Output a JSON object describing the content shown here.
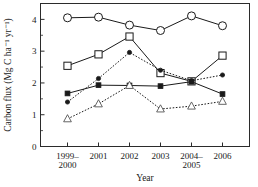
{
  "chart_data": {
    "type": "line",
    "title": "",
    "xlabel": "Year",
    "ylabel": "Carbon flux (Mg C ha⁻¹ yr⁻¹)",
    "categories": [
      "1999–2000",
      "2001",
      "2002",
      "2003",
      "2004–2005",
      "2006"
    ],
    "category_lines": [
      [
        "1999–",
        "2000"
      ],
      [
        "2001",
        ""
      ],
      [
        "2002",
        ""
      ],
      [
        "2003",
        ""
      ],
      [
        "2004–",
        "2005"
      ],
      [
        "2006",
        ""
      ]
    ],
    "ylim": [
      0,
      4.5
    ],
    "yticks": [
      0,
      1,
      2,
      3,
      4
    ],
    "ytick_labels": [
      "0",
      "1",
      "2",
      "3",
      "4"
    ],
    "y_minor_ticks": [
      0.5,
      1.5,
      2.5,
      3.5
    ],
    "grid": false,
    "legend": "none",
    "series": [
      {
        "name": "open-circle-solid",
        "marker": "circle-open",
        "line": "solid",
        "values": [
          4.05,
          4.07,
          3.82,
          3.65,
          4.11,
          3.8
        ]
      },
      {
        "name": "open-square-solid",
        "marker": "square-open",
        "line": "solid",
        "values": [
          2.54,
          2.9,
          3.46,
          2.31,
          2.05,
          2.86
        ]
      },
      {
        "name": "filled-circle-dotted",
        "marker": "circle-filled",
        "line": "dotted",
        "values": [
          1.4,
          2.14,
          2.96,
          2.4,
          2.07,
          2.25
        ]
      },
      {
        "name": "filled-square-solid",
        "marker": "square-filled",
        "line": "solid",
        "values": [
          1.67,
          1.93,
          1.92,
          1.9,
          2.04,
          1.65
        ]
      },
      {
        "name": "open-triangle-dotted",
        "marker": "triangle-open",
        "line": "dotted",
        "values": [
          0.87,
          1.34,
          1.92,
          1.18,
          1.27,
          1.42
        ]
      }
    ]
  }
}
